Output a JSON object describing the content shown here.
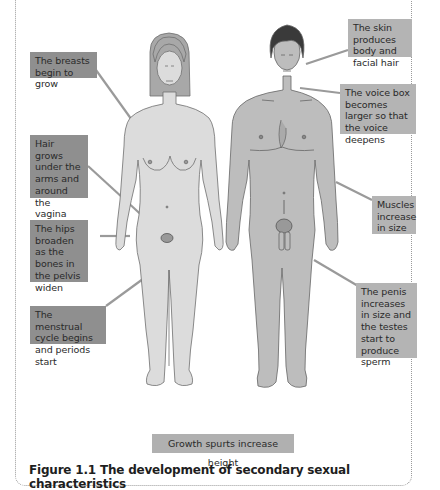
{
  "figure": {
    "caption": "Figure 1.1 The development of secondary sexual characteristics",
    "female_labels": [
      {
        "id": "breasts",
        "text": "The breasts begin to grow"
      },
      {
        "id": "hair",
        "text": "Hair grows under the arms and around the vagina"
      },
      {
        "id": "hips",
        "text": "The hips broaden as the bones in the pelvis widen"
      },
      {
        "id": "menstrual",
        "text": "The menstrual cycle begins and periods start"
      }
    ],
    "male_labels": [
      {
        "id": "skin",
        "text": "The skin produces body and facial hair"
      },
      {
        "id": "voice",
        "text": "The voice box becomes larger so that the voice deepens"
      },
      {
        "id": "muscles",
        "text": "Muscles increase in size"
      },
      {
        "id": "penis",
        "text": "The penis increases in size and the testes start to produce sperm"
      }
    ],
    "shared_label": "Growth spurts increase height",
    "colors": {
      "female_label_bg": "#8f8f8f",
      "male_label_bg": "#b4b4b4",
      "female_body": "#dcdcdc",
      "male_body": "#bdbdbd",
      "female_hair": "#a8a8a8",
      "male_hair": "#3a3a3a",
      "leader_line": "#9a9a9a"
    }
  }
}
